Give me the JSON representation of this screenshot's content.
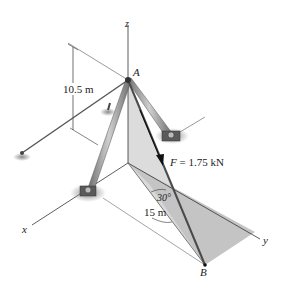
{
  "figure": {
    "axes": {
      "x": "x",
      "y": "y",
      "z": "z"
    },
    "points": {
      "A": "A",
      "B": "B"
    },
    "height_dimension": "10.5 m",
    "length_dimension": "15 m",
    "angle_label": "30°",
    "force_symbol": "F",
    "force_value": " = 1.75 kN"
  },
  "colors": {
    "shaded_plane": "#b8b8b8",
    "shaded_plane_light": "#d4d4d4",
    "members": "#8a8a8a",
    "force_arrow": "#111111"
  }
}
